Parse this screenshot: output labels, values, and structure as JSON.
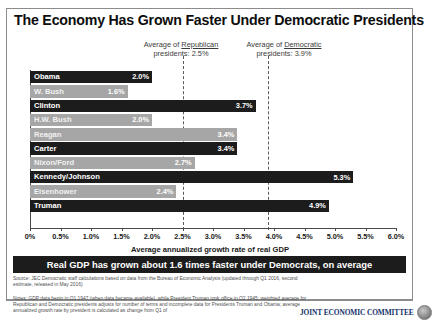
{
  "title": "The Economy Has Grown Faster Under Democratic Presidents",
  "annotations": {
    "republican": {
      "line1_prefix": "Average of ",
      "line1_underline": "Republican",
      "line2": "presidents: 2.5%",
      "value": 2.5
    },
    "democratic": {
      "line1_prefix": "Average of ",
      "line1_underline": "Democratic",
      "line2": "presidents: 3.9%",
      "value": 3.9
    }
  },
  "banner": "Real GDP has grown about 1.6 times faster under Democrats, on average",
  "source": "Source: JEC Democratic staff calculations based on data from the Bureau of Economic Analysis (updated through Q1 2016, second estimate, released in May 2016)",
  "notes": "Notes: GDP data begin in Q1 1947 (when data became available), while President Truman took office in Q2 1945; weighted average for Republican and Democratic presidents adjusts for number of terms and incomplete data for Presidents Truman and Obama; average annualized growth rate by president is calculated as change from Q1 of",
  "logo": {
    "text": "JOINT ECONOMIC COMMITTEE",
    "seal": "seal-icon"
  },
  "colors": {
    "democratic_bar": "#1c1c1c",
    "republican_bar": "#a6a6a6",
    "banner_bg": "#1c1c1c",
    "logo_text": "#14306b"
  },
  "chart_data": {
    "type": "bar",
    "title": "The Economy Has Grown Faster Under Democratic Presidents",
    "xlabel": "Average annualized growth rate of real GDP",
    "ylabel": "",
    "orientation": "horizontal",
    "xlim": [
      0,
      6.0
    ],
    "grid": false,
    "legend": "none",
    "tick_labels": [
      "0%",
      "0.5%",
      "1.0%",
      "1.5%",
      "2.0%",
      "2.5%",
      "3.0%",
      "3.5%",
      "4.0%",
      "4.5%",
      "5.0%",
      "5.5%",
      "6.0%"
    ],
    "tick_values": [
      0,
      0.5,
      1.0,
      1.5,
      2.0,
      2.5,
      3.0,
      3.5,
      4.0,
      4.5,
      5.0,
      5.5,
      6.0
    ],
    "categories": [
      "Obama",
      "W. Bush",
      "Clinton",
      "H.W. Bush",
      "Reagan",
      "Carter",
      "Nixon/Ford",
      "Kennedy/Johnson",
      "Eisenhower",
      "Truman"
    ],
    "values": [
      2.0,
      1.6,
      3.7,
      2.0,
      3.4,
      3.4,
      2.7,
      5.3,
      2.4,
      4.9
    ],
    "value_labels": [
      "2.0%",
      "1.6%",
      "3.7%",
      "2.0%",
      "3.4%",
      "3.4%",
      "2.7%",
      "5.3%",
      "2.4%",
      "4.9%"
    ],
    "party": [
      "Democratic",
      "Republican",
      "Democratic",
      "Republican",
      "Republican",
      "Democratic",
      "Republican",
      "Democratic",
      "Republican",
      "Democratic"
    ],
    "bars": [
      {
        "label": "Obama",
        "value": 2.0,
        "value_label": "2.0%",
        "party": "Democratic"
      },
      {
        "label": "W. Bush",
        "value": 1.6,
        "value_label": "1.6%",
        "party": "Republican"
      },
      {
        "label": "Clinton",
        "value": 3.7,
        "value_label": "3.7%",
        "party": "Democratic"
      },
      {
        "label": "H.W. Bush",
        "value": 2.0,
        "value_label": "2.0%",
        "party": "Republican"
      },
      {
        "label": "Reagan",
        "value": 3.4,
        "value_label": "3.4%",
        "party": "Republican"
      },
      {
        "label": "Carter",
        "value": 3.4,
        "value_label": "3.4%",
        "party": "Democratic"
      },
      {
        "label": "Nixon/Ford",
        "value": 2.7,
        "value_label": "2.7%",
        "party": "Republican"
      },
      {
        "label": "Kennedy/Johnson",
        "value": 5.3,
        "value_label": "5.3%",
        "party": "Democratic"
      },
      {
        "label": "Eisenhower",
        "value": 2.4,
        "value_label": "2.4%",
        "party": "Republican"
      },
      {
        "label": "Truman",
        "value": 4.9,
        "value_label": "4.9%",
        "party": "Democratic"
      }
    ],
    "reference_lines": [
      {
        "name": "Average of Republican presidents",
        "value": 2.5,
        "style": "dashed"
      },
      {
        "name": "Average of Democratic presidents",
        "value": 3.9,
        "style": "dashed"
      }
    ],
    "annotation": "Real GDP has grown about 1.6 times faster under Democrats, on average"
  }
}
